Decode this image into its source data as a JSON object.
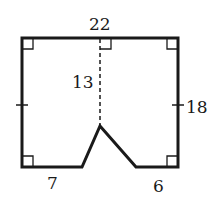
{
  "diagram": {
    "type": "composite-figure",
    "colors": {
      "stroke": "#1a1a1a",
      "background": "#ffffff"
    },
    "labels": {
      "top": "22",
      "height_dashed": "13",
      "right": "18",
      "bottom_left": "7",
      "bottom_right": "6"
    },
    "vertices": {
      "top_left": [
        22,
        38
      ],
      "top_right": [
        178,
        38
      ],
      "bottom_right": [
        178,
        167
      ],
      "notch_right": [
        136,
        167
      ],
      "apex": [
        100,
        126
      ],
      "notch_left": [
        82,
        167
      ],
      "bottom_left": [
        22,
        167
      ]
    },
    "marks": [
      "right-angle top-left",
      "right-angle top-middle",
      "right-angle top-right",
      "right-angle bottom-left",
      "right-angle bottom-right",
      "tick left side",
      "tick right side"
    ]
  }
}
